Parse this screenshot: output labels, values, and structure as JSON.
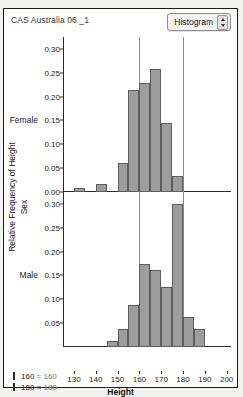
{
  "window": {
    "title": "CAS Australia 06 _1",
    "menu_button": {
      "label": "Histogram",
      "icon": "stepper-updown-icon"
    }
  },
  "axes": {
    "y_title": "Relative Frequency of Height",
    "group_axis_title": "Sex",
    "x_title": "Height",
    "x_ticks": [
      "130",
      "140",
      "150",
      "160",
      "170",
      "180",
      "190",
      "200"
    ],
    "x_min": 125,
    "x_max": 202,
    "top_y_ticks": [
      "0.30",
      "0.25",
      "0.20",
      "0.15",
      "0.10",
      "0.05",
      "0.00"
    ],
    "bottom_y_ticks": [
      "0.30",
      "0.25",
      "0.20",
      "0.15",
      "0.10",
      "0.05"
    ],
    "y_min": 0,
    "y_max": 0.325
  },
  "reference_lines": [
    160,
    180
  ],
  "legend": {
    "items": [
      {
        "name": "160",
        "equals": "=",
        "value": "160"
      },
      {
        "name": "180",
        "equals": "=",
        "value": "180"
      }
    ]
  },
  "colors": {
    "bar_fill": "#9d9d9d",
    "bar_stroke": "#5d5d5d",
    "reference_line": "#8a8a8a",
    "axis": "#2b2b2b"
  },
  "chart_data": {
    "type": "bar",
    "title": "CAS Australia 06 _1",
    "xlabel": "Height",
    "ylabel": "Relative Frequency of Height",
    "xlim": [
      125,
      202
    ],
    "ylim": [
      0,
      0.325
    ],
    "grid": false,
    "legend_position": "bottom-left",
    "bin_width": 5,
    "annotations": [
      "160 = 160",
      "180 = 180"
    ],
    "reference_lines": [
      160,
      180
    ],
    "panels": [
      {
        "name": "Female",
        "bins": [
          {
            "start": 130,
            "end": 135,
            "value": 0.008
          },
          {
            "start": 140,
            "end": 145,
            "value": 0.017
          },
          {
            "start": 150,
            "end": 155,
            "value": 0.06
          },
          {
            "start": 155,
            "end": 160,
            "value": 0.213
          },
          {
            "start": 160,
            "end": 165,
            "value": 0.229
          },
          {
            "start": 165,
            "end": 170,
            "value": 0.257
          },
          {
            "start": 170,
            "end": 175,
            "value": 0.145
          },
          {
            "start": 175,
            "end": 180,
            "value": 0.034
          }
        ]
      },
      {
        "name": "Male",
        "bins": [
          {
            "start": 145,
            "end": 150,
            "value": 0.012
          },
          {
            "start": 150,
            "end": 155,
            "value": 0.037
          },
          {
            "start": 155,
            "end": 160,
            "value": 0.088
          },
          {
            "start": 160,
            "end": 165,
            "value": 0.175
          },
          {
            "start": 165,
            "end": 170,
            "value": 0.161
          },
          {
            "start": 170,
            "end": 175,
            "value": 0.125
          },
          {
            "start": 175,
            "end": 180,
            "value": 0.3
          },
          {
            "start": 180,
            "end": 185,
            "value": 0.063
          },
          {
            "start": 185,
            "end": 190,
            "value": 0.037
          }
        ]
      }
    ]
  }
}
